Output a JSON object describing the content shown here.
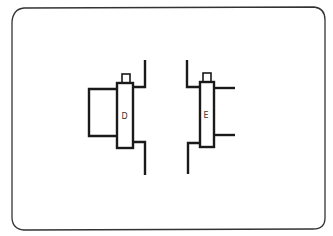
{
  "diagram": {
    "colors": {
      "stroke": "#1a1a1a",
      "frame": "#333333",
      "background": "#ffffff"
    },
    "components": [
      {
        "id": "left-assembly",
        "label": "D"
      },
      {
        "id": "right-assembly",
        "label": "E"
      }
    ]
  }
}
